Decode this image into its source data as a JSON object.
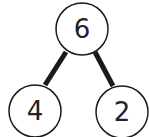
{
  "diagram": {
    "type": "number-bond",
    "whole": {
      "value": "6"
    },
    "parts": [
      {
        "value": "4"
      },
      {
        "value": "2"
      }
    ],
    "colors": {
      "stroke": "#1a1a1a",
      "fill": "#ffffff",
      "text": "#222222"
    }
  }
}
